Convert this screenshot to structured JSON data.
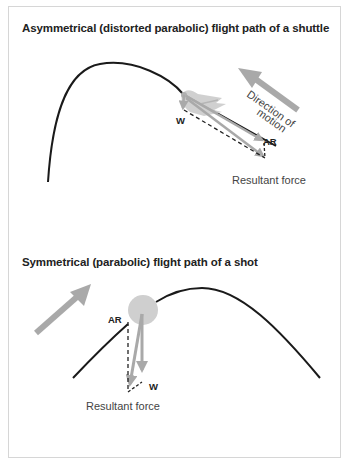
{
  "diagrams": {
    "top": {
      "title": "Asymmetrical (distorted parabolic) flight path of a shuttle",
      "projectile": "shuttlecock",
      "labels": {
        "weight": "W",
        "air_resistance": "AR",
        "resultant": "Resultant force",
        "direction_line1": "Direction of",
        "direction_line2": "motion"
      }
    },
    "bottom": {
      "title": "Symmetrical (parabolic) flight path of a shot",
      "projectile": "shot",
      "labels": {
        "weight": "W",
        "air_resistance": "AR",
        "resultant": "Resultant force"
      }
    }
  },
  "colors": {
    "path": "#1a1a1a",
    "arrow": "#a9a9a9",
    "shot": "#cfcfcf",
    "border": "#d6d6d6",
    "text": "#222222"
  }
}
